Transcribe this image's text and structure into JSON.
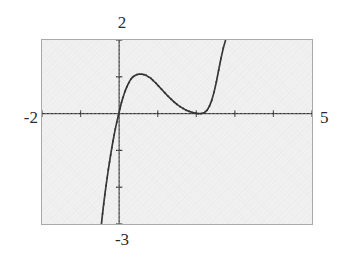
{
  "figure": {
    "title": "",
    "axis_labels": {
      "top": "2",
      "bottom": "-3",
      "left": "-2",
      "right": "5"
    },
    "frame_color": "#a9a9a9",
    "plot_background": "#f1f1f1",
    "curve_color": "#333333",
    "axis_color": "#333333"
  },
  "chart_data": {
    "type": "line",
    "title": "",
    "xlabel": "",
    "ylabel": "",
    "xlim": [
      -2,
      5
    ],
    "ylim": [
      -3,
      2
    ],
    "grid": false,
    "legend": null,
    "style": "dotted-plot-points",
    "x_ticks": [
      -2,
      -1,
      0,
      1,
      2,
      3,
      4,
      5
    ],
    "y_ticks": [
      -3,
      -2,
      -1,
      0,
      1,
      2
    ],
    "axes_drawn": {
      "x_axis_at_y": 0,
      "y_axis_at_x": 0
    },
    "features": {
      "local_maximum": {
        "x": 0.62,
        "y": 1.07
      },
      "local_minimum": {
        "x": 2.2,
        "y": 0.02
      },
      "x_intercepts": [
        -0.12,
        2.2
      ],
      "steep_left_branch_from": {
        "x": -0.45,
        "y": -3
      },
      "steep_right_branch_to": {
        "x": 2.75,
        "y": 2
      }
    },
    "series": [
      {
        "name": "curve",
        "x": [
          -0.46,
          -0.43,
          -0.4,
          -0.37,
          -0.34,
          -0.31,
          -0.28,
          -0.25,
          -0.22,
          -0.19,
          -0.16,
          -0.13,
          -0.1,
          -0.06,
          -0.02,
          0.02,
          0.06,
          0.1,
          0.15,
          0.2,
          0.25,
          0.3,
          0.35,
          0.4,
          0.46,
          0.52,
          0.58,
          0.64,
          0.7,
          0.76,
          0.82,
          0.88,
          0.95,
          1.02,
          1.1,
          1.18,
          1.26,
          1.34,
          1.42,
          1.5,
          1.58,
          1.66,
          1.74,
          1.82,
          1.9,
          1.98,
          2.05,
          2.12,
          2.2,
          2.28,
          2.34,
          2.4,
          2.46,
          2.52,
          2.58,
          2.64,
          2.7,
          2.76
        ],
        "y": [
          -3.0,
          -2.72,
          -2.45,
          -2.2,
          -1.96,
          -1.74,
          -1.52,
          -1.32,
          -1.12,
          -0.93,
          -0.75,
          -0.58,
          -0.42,
          -0.23,
          -0.05,
          0.13,
          0.3,
          0.44,
          0.6,
          0.73,
          0.84,
          0.93,
          0.99,
          1.03,
          1.06,
          1.07,
          1.07,
          1.06,
          1.04,
          1.0,
          0.96,
          0.9,
          0.83,
          0.75,
          0.66,
          0.57,
          0.48,
          0.4,
          0.32,
          0.25,
          0.19,
          0.14,
          0.09,
          0.06,
          0.03,
          0.01,
          0.0,
          0.0,
          0.02,
          0.09,
          0.2,
          0.36,
          0.58,
          0.86,
          1.18,
          1.5,
          1.78,
          2.0
        ]
      }
    ]
  }
}
